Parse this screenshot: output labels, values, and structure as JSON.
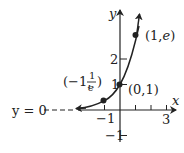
{
  "diagram": {
    "function": "y = e^x",
    "x_axis_label": "x",
    "y_axis_label": "y",
    "asymptote_label": "y = 0",
    "x_tick_labels": {
      "neg1": "−1",
      "pos3": "3"
    },
    "y_tick_labels": {
      "pos1": "1",
      "pos2": "2",
      "neg1": "−1"
    },
    "points": [
      {
        "label_a": "(−1, ",
        "label_num": "1",
        "label_den": "e",
        "label_b": ")",
        "x": -1,
        "y": 0.3679
      },
      {
        "label": "(0,1)",
        "x": 0,
        "y": 1
      },
      {
        "label_a": "(1,",
        "label_e": "e",
        "label_b": ")",
        "x": 1,
        "y": 2.718
      }
    ],
    "colors": {
      "ink": "#222222",
      "background": "#ffffff"
    }
  }
}
